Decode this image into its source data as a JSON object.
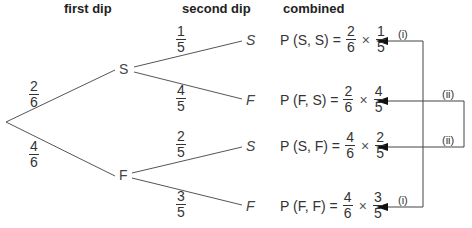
{
  "headers": {
    "first": "first dip",
    "second": "second dip",
    "combined": "combined"
  },
  "nodes": {
    "first_S": "S",
    "first_F": "F"
  },
  "first_branches": [
    {
      "num": "2",
      "den": "6"
    },
    {
      "num": "4",
      "den": "6"
    }
  ],
  "second_branches": [
    {
      "num": "1",
      "den": "5"
    },
    {
      "num": "4",
      "den": "5"
    },
    {
      "num": "2",
      "den": "5"
    },
    {
      "num": "3",
      "den": "5"
    }
  ],
  "leaves": [
    "S",
    "F",
    "S",
    "F"
  ],
  "combined": [
    {
      "label": "P (S, S) =",
      "f1n": "2",
      "f1d": "6",
      "times": "×",
      "f2n": "1",
      "f2d": "5"
    },
    {
      "label": "P (F, S) =",
      "f1n": "2",
      "f1d": "6",
      "times": "×",
      "f2n": "4",
      "f2d": "5"
    },
    {
      "label": "P (S, F) =",
      "f1n": "4",
      "f1d": "6",
      "times": "×",
      "f2n": "2",
      "f2d": "5"
    },
    {
      "label": "P (F, F) =",
      "f1n": "4",
      "f1d": "6",
      "times": "×",
      "f2n": "3",
      "f2d": "5"
    }
  ],
  "brackets": {
    "i_top": "(i)",
    "ii_top": "(ii)",
    "ii_bottom": "(ii)",
    "i_bottom": "(i)"
  }
}
